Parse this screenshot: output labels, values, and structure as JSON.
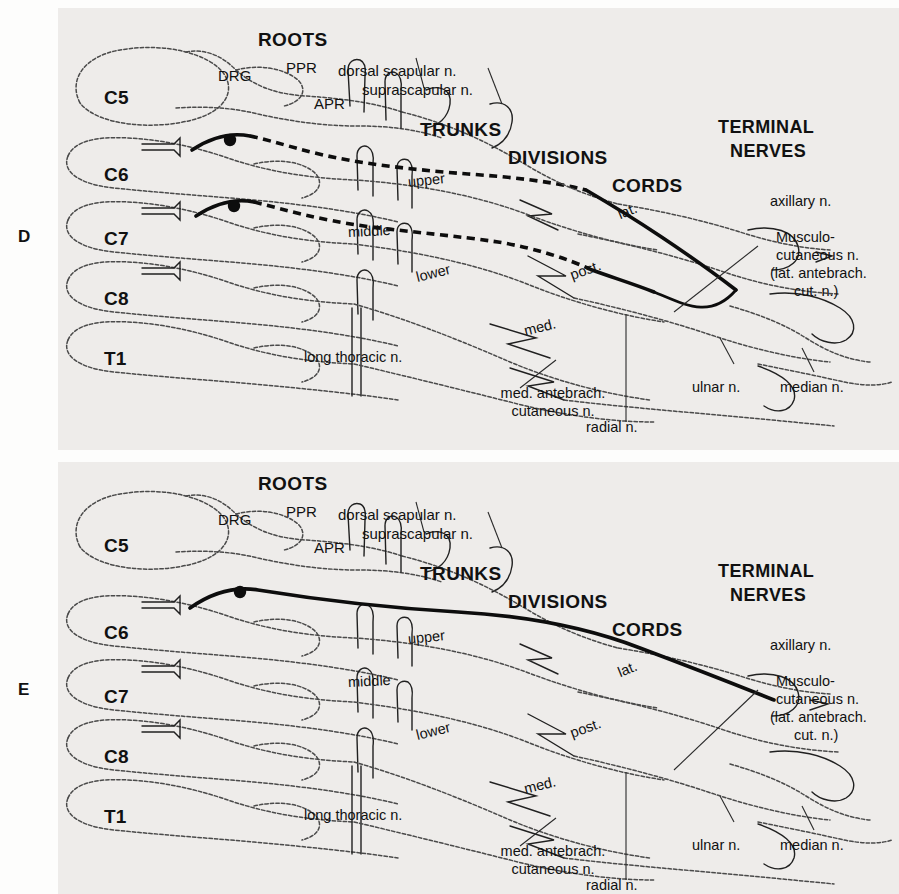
{
  "figure": {
    "type": "anatomical-diagram",
    "panels": [
      {
        "letter": "D",
        "highlight_style": "dashed",
        "highlight_description": "Two dashed fiber paths originating from C5 and C6 posterior primary rami region, converging into the posterior cord and terminating at the radial nerve",
        "headers": {
          "roots": "ROOTS",
          "trunks": "TRUNKS",
          "divisions": "DIVISIONS",
          "cords": "CORDS",
          "terminal_nerves_line1": "TERMINAL",
          "terminal_nerves_line2": "NERVES"
        },
        "roots": [
          "C5",
          "C6",
          "C7",
          "C8",
          "T1"
        ],
        "root_structures": [
          "DRG",
          "PPR",
          "APR"
        ],
        "branch_labels": [
          "dorsal scapular n.",
          "suprascapular n.",
          "long thoracic n.",
          "med. antebrach.",
          "cutaneous n."
        ],
        "trunks": [
          "upper",
          "middle",
          "lower"
        ],
        "cords": [
          "lat.",
          "post.",
          "med."
        ],
        "terminal_nerves": [
          "axillary n.",
          "Musculo-",
          "cutaneous n.",
          "(lat. antebrach.",
          "cut. n.)",
          "radial n.",
          "ulnar n.",
          "median n."
        ]
      },
      {
        "letter": "E",
        "highlight_style": "solid",
        "highlight_description": "A single thick solid fiber path originating from C5 anterior primary ramus, running through the upper trunk and lateral cord to terminate at the musculocutaneous nerve",
        "headers": {
          "roots": "ROOTS",
          "trunks": "TRUNKS",
          "divisions": "DIVISIONS",
          "cords": "CORDS",
          "terminal_nerves_line1": "TERMINAL",
          "terminal_nerves_line2": "NERVES"
        },
        "roots": [
          "C5",
          "C6",
          "C7",
          "C8",
          "T1"
        ],
        "root_structures": [
          "DRG",
          "PPR",
          "APR"
        ],
        "branch_labels": [
          "dorsal scapular n.",
          "suprascapular n.",
          "long thoracic n.",
          "med. antebrach.",
          "cutaneous n."
        ],
        "trunks": [
          "upper",
          "middle",
          "lower"
        ],
        "cords": [
          "lat.",
          "post.",
          "med."
        ],
        "terminal_nerves": [
          "axillary n.",
          "Musculo-",
          "cutaneous n.",
          "(lat. antebrach.",
          "cut. n.)",
          "radial n.",
          "ulnar n.",
          "median n."
        ]
      }
    ],
    "colors": {
      "panel_background": "#eeecea",
      "page_background": "#fdfdfc",
      "ink": "#111111",
      "nerve_outline": "#4a4a4a",
      "highlight": "#0d0d0d"
    }
  }
}
